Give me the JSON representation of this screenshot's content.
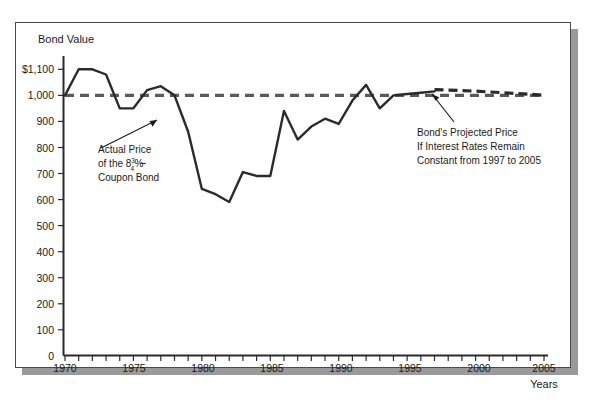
{
  "figure": {
    "frame_border_color": "#4a4a4a",
    "shadow_color": "#9a9a9a",
    "background": "#ffffff"
  },
  "chart_data": {
    "type": "line",
    "title": "",
    "ylabel": "Bond Value",
    "xlabel": "Years",
    "ylim": [
      0,
      1150
    ],
    "xlim": [
      1970,
      2005
    ],
    "grid": false,
    "legend": "none",
    "y_ticks": [
      0,
      100,
      200,
      300,
      400,
      500,
      600,
      700,
      800,
      900,
      1000,
      1100
    ],
    "y_tick_labels": [
      "0",
      "100",
      "200",
      "300",
      "400",
      "500",
      "600",
      "700",
      "800",
      "900",
      "1,000",
      "$1,100"
    ],
    "x_ticks": [
      1970,
      1971,
      1972,
      1973,
      1974,
      1975,
      1976,
      1977,
      1978,
      1979,
      1980,
      1981,
      1982,
      1983,
      1984,
      1985,
      1986,
      1987,
      1988,
      1989,
      1990,
      1991,
      1992,
      1993,
      1994,
      1995,
      1996,
      1997,
      1998,
      1999,
      2000,
      2001,
      2002,
      2003,
      2004,
      2005
    ],
    "x_tick_labels": [
      "1970",
      "1975",
      "1980",
      "1985",
      "1990",
      "1995",
      "2000",
      "2005"
    ],
    "x_labeled_ticks": [
      1970,
      1975,
      1980,
      1985,
      1990,
      1995,
      2000,
      2005
    ],
    "series": [
      {
        "name": "Actual Price of the 8 3/4% Coupon Bond",
        "style": "solid",
        "color": "#2b2b2b",
        "x": [
          1970,
          1971,
          1972,
          1973,
          1974,
          1975,
          1976,
          1977,
          1978,
          1979,
          1980,
          1981,
          1982,
          1983,
          1984,
          1985,
          1986,
          1987,
          1988,
          1989,
          1990,
          1991,
          1992,
          1993,
          1994,
          1995,
          1996,
          1997
        ],
        "values": [
          1000,
          1100,
          1100,
          1080,
          950,
          950,
          1020,
          1035,
          1000,
          860,
          640,
          620,
          590,
          705,
          690,
          690,
          940,
          830,
          880,
          910,
          890,
          980,
          1040,
          950,
          1000,
          1005,
          1010,
          1015
        ]
      },
      {
        "name": "Par value reference line",
        "style": "dashed",
        "color": "#5a5a5a",
        "x": [
          1970,
          2005
        ],
        "values": [
          1000,
          1000
        ]
      },
      {
        "name": "Bond's Projected Price If Interest Rates Remain Constant from 1997 to 2005",
        "style": "dashed",
        "color": "#2b2b2b",
        "x": [
          1997,
          1998,
          1999,
          2000,
          2001,
          2002,
          2003,
          2004,
          2005
        ],
        "values": [
          1022,
          1020,
          1018,
          1016,
          1013,
          1010,
          1007,
          1004,
          1000
        ]
      }
    ],
    "annotations": [
      {
        "id": "actual-price",
        "lines": [
          "Actual Price",
          "of the 8¾%",
          "Coupon Bond"
        ],
        "line1": "Actual Price",
        "line2_prefix": "of the 8",
        "line2_numerator": "3",
        "line2_denominator": "4",
        "line2_suffix": "%",
        "line3": "Coupon Bond",
        "arrow_points_to": [
          1977.8,
          905
        ]
      },
      {
        "id": "projected-price",
        "lines": [
          "Bond's Projected Price",
          "If Interest Rates Remain",
          "Constant from 1997 to 2005"
        ],
        "line1": "Bond's Projected Price",
        "line2": "If Interest Rates Remain",
        "line3": "Constant from 1997 to 2005",
        "arrow_points_to": [
          1997.5,
          1018
        ]
      }
    ]
  }
}
